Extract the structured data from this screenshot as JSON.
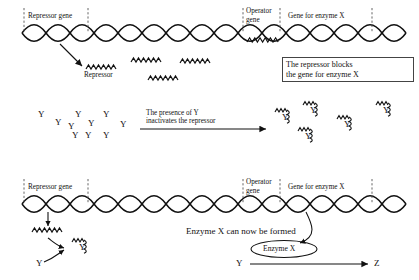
{
  "figure": {
    "type": "biology-diagram",
    "panels": 3
  },
  "colors": {
    "ink": "#111111",
    "dashed": "#555555",
    "background": "#ffffff",
    "box_border": "#444444"
  },
  "panel_top": {
    "labels": {
      "repressor_gene": "Repressor gene",
      "operator_gene_line1": "Operator",
      "operator_gene_line2": "gene",
      "gene_for_enzyme_x": "Gene for enzyme X",
      "repressor": "Repressor"
    },
    "callout": {
      "line1": "The repressor blocks",
      "line2": "the gene for enzyme X"
    },
    "free_repressor_count": 4,
    "operator_blocked": true
  },
  "panel_middle": {
    "free_y_label": "Y",
    "free_y_count": 10,
    "arrow_caption_line1": "The presence of Y",
    "arrow_caption_line2": "inactivates the repressor",
    "complex_label": "Y",
    "complex_count": 5
  },
  "panel_bottom": {
    "labels": {
      "repressor_gene": "Repressor gene",
      "operator_gene_line1": "Operator",
      "operator_gene_line2": "gene",
      "gene_for_enzyme_x": "Gene for enzyme X",
      "y_free": "Y",
      "complex_y": "Y"
    },
    "caption": "Enzyme X can now be formed",
    "enzyme_bubble": "Enzyme X",
    "reaction": {
      "substrate": "Y",
      "product": "Z"
    },
    "operator_blocked": false
  }
}
